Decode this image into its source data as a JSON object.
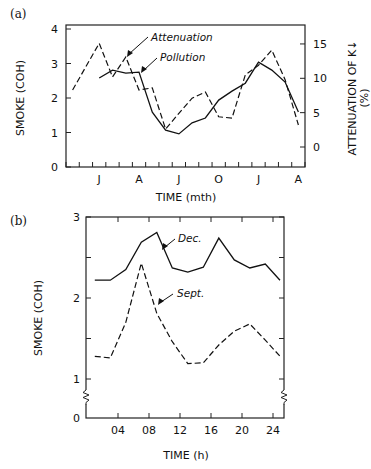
{
  "chart_data": [
    {
      "panel": "(a)",
      "type": "line",
      "title": "",
      "xlabel": "TIME (mth)",
      "ylabel": "SMOKE (COH)",
      "y2label": "ATTENUATION OF K↓",
      "y2label_unit": "(%)",
      "x_months": [
        "Nov",
        "Dec",
        "Jan",
        "Feb",
        "Mar",
        "Apr",
        "May",
        "Jun",
        "Jul",
        "Aug",
        "Sep",
        "Oct",
        "Nov",
        "Dec",
        "Jan",
        "Feb",
        "Mar",
        "Apr"
      ],
      "x_tick_labels": [
        {
          "label": "J",
          "index": 2
        },
        {
          "label": "A",
          "index": 5
        },
        {
          "label": "J",
          "index": 8
        },
        {
          "label": "O",
          "index": 11
        },
        {
          "label": "J",
          "index": 14
        },
        {
          "label": "A",
          "index": 17
        }
      ],
      "ylim": [
        0,
        4
      ],
      "yticks": [
        "0",
        "1",
        "2",
        "3",
        "4"
      ],
      "y2lim": [
        -3,
        17
      ],
      "y2ticks": [
        "0",
        "5",
        "10",
        "15"
      ],
      "grid": false,
      "series": [
        {
          "name": "Pollution",
          "axis": "left",
          "style": "solid",
          "x": [
            2,
            3,
            4,
            5,
            6,
            7,
            8,
            9,
            10,
            11,
            12,
            13,
            14,
            15,
            16,
            17
          ],
          "values": [
            2.58,
            2.81,
            2.72,
            2.75,
            1.59,
            1.07,
            0.96,
            1.28,
            1.42,
            1.94,
            2.2,
            2.43,
            3.04,
            2.81,
            2.46,
            1.59
          ]
        },
        {
          "name": "Attenuation",
          "axis": "right",
          "style": "dashed",
          "x": [
            0,
            2,
            3,
            4,
            5,
            6,
            7,
            8,
            9,
            10,
            11,
            12,
            13,
            14,
            15,
            16,
            17
          ],
          "values": [
            8.3,
            15.1,
            10.2,
            13.1,
            8.3,
            8.6,
            2.6,
            4.9,
            7.1,
            8.0,
            4.4,
            4.2,
            10.5,
            11.9,
            14.1,
            9.8,
            3.2
          ]
        }
      ],
      "annotations": [
        {
          "text": "Attenuation",
          "points_to": "dashed line"
        },
        {
          "text": "Pollution",
          "points_to": "solid line"
        }
      ]
    },
    {
      "panel": "(b)",
      "type": "line",
      "title": "",
      "xlabel": "TIME (h)",
      "ylabel": "SMOKE (COH)",
      "xticks": [
        "04",
        "08",
        "12",
        "16",
        "20",
        "24"
      ],
      "yticks": [
        "0",
        "1",
        "2",
        "3"
      ],
      "ylim": [
        0,
        3
      ],
      "axis_break": "between 0 and 1",
      "grid": false,
      "series": [
        {
          "name": "Dec.",
          "style": "solid",
          "x": [
            1,
            3,
            5,
            7,
            9,
            11,
            13,
            15,
            17,
            19,
            21,
            23,
            25
          ],
          "values": [
            2.22,
            2.22,
            2.35,
            2.69,
            2.81,
            2.37,
            2.32,
            2.38,
            2.74,
            2.47,
            2.37,
            2.42,
            2.22
          ]
        },
        {
          "name": "Sept.",
          "style": "dashed",
          "x": [
            1,
            3,
            5,
            7,
            9,
            11,
            13,
            15,
            17,
            19,
            21,
            23,
            25
          ],
          "values": [
            1.28,
            1.26,
            1.7,
            2.43,
            1.81,
            1.46,
            1.19,
            1.2,
            1.42,
            1.59,
            1.68,
            1.48,
            1.28
          ]
        }
      ],
      "annotations": [
        {
          "text": "Dec.",
          "points_to": "solid line"
        },
        {
          "text": "Sept.",
          "points_to": "dashed line"
        }
      ]
    }
  ],
  "labels": {
    "panel_a": "(a)",
    "panel_b": "(b)",
    "a_ylabel": "SMOKE (COH)",
    "a_y2label": "ATTENUATION OF K↓",
    "a_y2unit": "(%)",
    "a_xlabel": "TIME (mth)",
    "a_ann_attenuation": "Attenuation",
    "a_ann_pollution": "Pollution",
    "b_ylabel": "SMOKE (COH)",
    "b_xlabel": "TIME (h)",
    "b_ann_dec": "Dec.",
    "b_ann_sept": "Sept."
  }
}
